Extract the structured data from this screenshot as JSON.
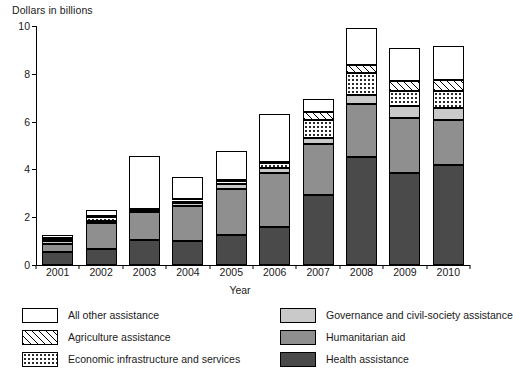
{
  "chart_data": {
    "type": "bar",
    "stacked": true,
    "title": "",
    "ylabel": "Dollars in billions",
    "xlabel": "Year",
    "ylim": [
      0,
      10
    ],
    "yticks": [
      0,
      2,
      4,
      6,
      8,
      10
    ],
    "grid": false,
    "legend_position": "bottom",
    "categories": [
      "2001",
      "2002",
      "2003",
      "2004",
      "2005",
      "2006",
      "2007",
      "2008",
      "2009",
      "2010"
    ],
    "series": [
      {
        "name": "Health assistance",
        "color": "#4a4a4a",
        "pattern": "solid-dark-gray",
        "values": [
          0.55,
          0.65,
          1.05,
          1.0,
          1.25,
          1.6,
          2.95,
          4.5,
          3.85,
          4.2
        ]
      },
      {
        "name": "Humanitarian aid",
        "color": "#8f8f8f",
        "pattern": "solid-mid-gray",
        "values": [
          0.35,
          1.1,
          1.15,
          1.45,
          1.95,
          2.25,
          2.1,
          2.25,
          2.3,
          1.85
        ]
      },
      {
        "name": "Governance and civil-society assistance",
        "color": "#c9c9c9",
        "pattern": "solid-light-gray",
        "values": [
          0.1,
          0.1,
          0.05,
          0.15,
          0.2,
          0.2,
          0.25,
          0.35,
          0.5,
          0.5
        ]
      },
      {
        "name": "Economic infrastructure and services",
        "color": "#ffffff",
        "pattern": "dotted",
        "values": [
          0.1,
          0.15,
          0.05,
          0.1,
          0.1,
          0.2,
          0.75,
          0.95,
          0.65,
          0.75
        ]
      },
      {
        "name": "Agriculture assistance",
        "color": "#ffffff",
        "pattern": "diagonal-hatch",
        "values": [
          0.05,
          0.05,
          0.05,
          0.05,
          0.05,
          0.05,
          0.35,
          0.3,
          0.4,
          0.45
        ]
      },
      {
        "name": "All other assistance",
        "color": "#ffffff",
        "pattern": "blank",
        "values": [
          0.1,
          0.25,
          2.2,
          0.95,
          1.2,
          2.0,
          0.55,
          1.55,
          1.4,
          1.4
        ]
      }
    ]
  },
  "axes": {
    "y_title": "Dollars in billions",
    "x_title": "Year",
    "y_tick_labels": [
      "0",
      "2",
      "4",
      "6",
      "8",
      "10"
    ],
    "x_tick_labels": [
      "2001",
      "2002",
      "2003",
      "2004",
      "2005",
      "2006",
      "2007",
      "2008",
      "2009",
      "2010"
    ]
  },
  "legend": {
    "left_items": [
      {
        "label": "All other assistance",
        "swatch": "blank"
      },
      {
        "label": "Agriculture assistance",
        "swatch": "diagonal-hatch"
      },
      {
        "label": "Economic infrastructure and services",
        "swatch": "dotted"
      }
    ],
    "right_items": [
      {
        "label": "Governance and civil-society assistance",
        "swatch": "solid-light-gray"
      },
      {
        "label": "Humanitarian aid",
        "swatch": "solid-mid-gray"
      },
      {
        "label": "Health assistance",
        "swatch": "solid-dark-gray"
      }
    ]
  }
}
